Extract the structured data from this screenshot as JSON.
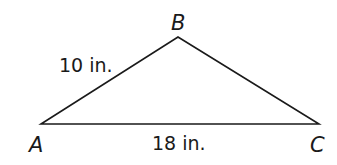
{
  "diagram": {
    "type": "triangle",
    "stroke_color": "#1a1a1a",
    "background": "#ffffff",
    "vertices": [
      {
        "label": "A",
        "x": 41,
        "y": 124
      },
      {
        "label": "B",
        "x": 178,
        "y": 37
      },
      {
        "label": "C",
        "x": 319,
        "y": 124
      }
    ],
    "sides": [
      {
        "between": "A-B",
        "length_label": "10 in."
      },
      {
        "between": "A-C",
        "length_label": "18 in."
      }
    ]
  }
}
